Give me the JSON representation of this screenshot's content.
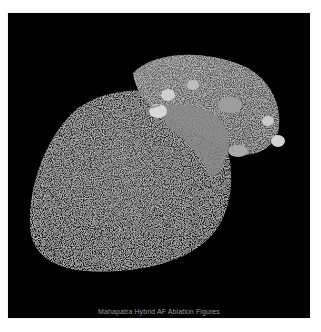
{
  "figure": {
    "caption": "Mahapatra Hybrid AF Ablation Figures",
    "background_color": "#000000",
    "page_background": "#ffffff"
  }
}
